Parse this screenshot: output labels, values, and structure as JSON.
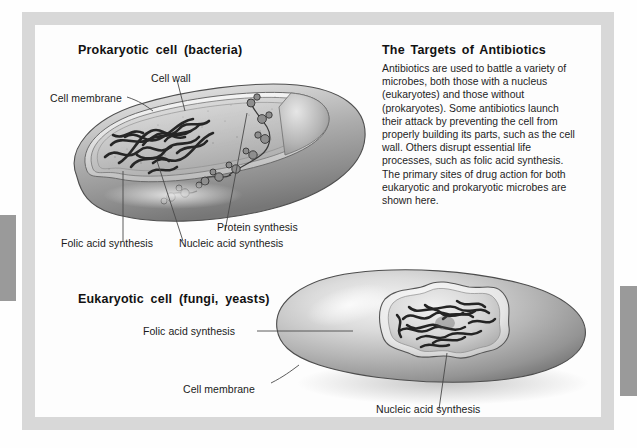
{
  "figure": {
    "sections": {
      "prokaryote_title": "Prokaryotic cell  (bacteria)",
      "eukaryote_title": "Eukaryotic cell  (fungi, yeasts)"
    },
    "blurb": {
      "heading": "The Targets of Antibiotics",
      "body": "Antibiotics are used to battle a variety of microbes, both those with a nucleus (eukaryotes) and those without (prokaryotes). Some antibiotics launch their attack by preventing the cell from properly building its parts, such as the cell wall. Others disrupt essential life processes, such as folic acid synthesis. The primary sites of drug action for both eukaryotic and prokaryotic microbes are shown here."
    },
    "prokaryote_labels": {
      "cell_wall": "Cell wall",
      "cell_membrane": "Cell membrane",
      "protein_synthesis": "Protein synthesis",
      "folic_acid_synthesis": "Folic acid synthesis",
      "nucleic_acid_synthesis": "Nucleic acid synthesis"
    },
    "eukaryote_labels": {
      "folic_acid_synthesis": "Folic acid synthesis",
      "cell_membrane": "Cell membrane",
      "nucleic_acid_synthesis": "Nucleic acid synthesis"
    },
    "colors": {
      "page_background": "#fefefe",
      "frame": "#d8d8d8",
      "panel": "#fdfdfd",
      "edge_tab": "#9a9a9a",
      "text": "#1b1b1b",
      "leader_line": "#4a4a4a",
      "cell_body_light": "#e9e9e9",
      "cell_body_mid": "#b9b9b9",
      "cell_body_dark": "#8a8a8a",
      "dna_strand": "#2a2a2a"
    }
  }
}
